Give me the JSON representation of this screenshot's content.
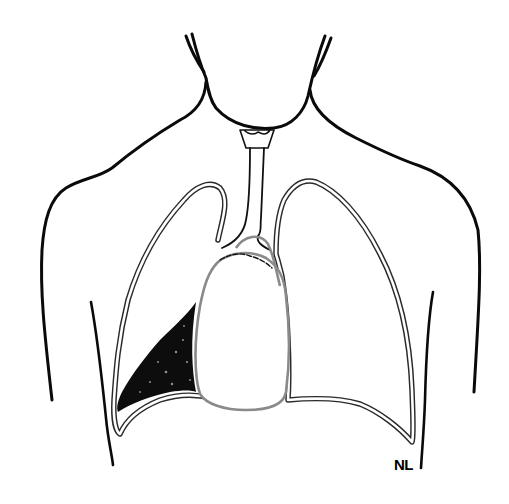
{
  "figure": {
    "signature": "NL",
    "colors": {
      "background": "#ffffff",
      "outline": "#0a0a0a",
      "lung_outline": "#2a2a2a",
      "heart_outline": "#8a8a8a",
      "effusion_fill": "#0d0d0d"
    },
    "elements": [
      "neck-outline",
      "shoulder-left",
      "shoulder-right",
      "trachea",
      "larynx",
      "lung-right-anatomical",
      "lung-left-anatomical",
      "heart",
      "pleural-effusion",
      "chest-wall-left",
      "chest-wall-right",
      "signature"
    ]
  }
}
